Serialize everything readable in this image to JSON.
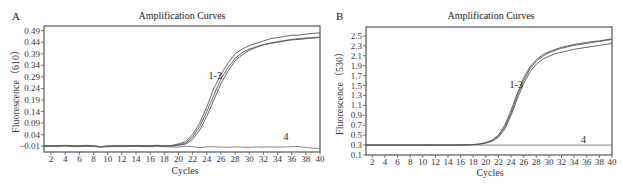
{
  "figure": {
    "panels": [
      "A",
      "B"
    ]
  },
  "chart_data": [
    {
      "panel": "A",
      "type": "line",
      "title": "Amplification Curves",
      "xlabel": "Cycles",
      "ylabel": "Fluorescence（610）",
      "xlim": [
        1,
        40
      ],
      "ylim": [
        -0.035,
        0.51
      ],
      "x_ticks": [
        2,
        4,
        6,
        8,
        10,
        12,
        14,
        16,
        18,
        20,
        22,
        24,
        26,
        28,
        30,
        32,
        34,
        36,
        38,
        40
      ],
      "y_ticks": [
        -0.01,
        0.04,
        0.09,
        0.14,
        0.19,
        0.24,
        0.29,
        0.34,
        0.39,
        0.44,
        0.49
      ],
      "y_tick_labels": [
        "−0.01",
        "0.04",
        "0.09",
        "0.14",
        "0.19",
        "0.24",
        "0.29",
        "0.34",
        "0.39",
        "0.44",
        "0.49"
      ],
      "grid": false,
      "annotations": [
        {
          "text": "1-3",
          "x": 25.2,
          "y": 0.28
        },
        {
          "text": "4",
          "x": 35.2,
          "y": 0.015
        }
      ],
      "x": [
        1,
        2,
        3,
        4,
        5,
        6,
        7,
        8,
        9,
        10,
        11,
        12,
        13,
        14,
        15,
        16,
        17,
        18,
        19,
        20,
        21,
        22,
        23,
        24,
        25,
        26,
        27,
        28,
        29,
        30,
        31,
        32,
        33,
        34,
        35,
        36,
        37,
        38,
        39,
        40
      ],
      "series": [
        {
          "name": "1",
          "values": [
            -0.008,
            -0.01,
            -0.009,
            -0.006,
            -0.008,
            -0.01,
            -0.006,
            -0.009,
            -0.013,
            -0.01,
            -0.008,
            -0.009,
            -0.008,
            -0.007,
            -0.009,
            -0.008,
            -0.006,
            -0.008,
            -0.007,
            0.0,
            0.01,
            0.04,
            0.09,
            0.16,
            0.24,
            0.3,
            0.35,
            0.39,
            0.41,
            0.425,
            0.435,
            0.445,
            0.455,
            0.46,
            0.465,
            0.47,
            0.47,
            0.475,
            0.478,
            0.48
          ]
        },
        {
          "name": "2",
          "values": [
            -0.009,
            -0.008,
            -0.01,
            -0.007,
            -0.009,
            -0.009,
            -0.008,
            -0.01,
            -0.012,
            -0.009,
            -0.009,
            -0.008,
            -0.009,
            -0.008,
            -0.008,
            -0.009,
            -0.007,
            -0.009,
            -0.008,
            -0.004,
            0.003,
            0.03,
            0.075,
            0.14,
            0.21,
            0.28,
            0.33,
            0.37,
            0.395,
            0.41,
            0.42,
            0.43,
            0.435,
            0.44,
            0.445,
            0.45,
            0.452,
            0.455,
            0.458,
            0.46
          ]
        },
        {
          "name": "3",
          "values": [
            -0.01,
            -0.009,
            -0.008,
            -0.008,
            -0.01,
            -0.008,
            -0.009,
            -0.009,
            -0.011,
            -0.01,
            -0.01,
            -0.009,
            -0.01,
            -0.009,
            -0.01,
            -0.009,
            -0.008,
            -0.01,
            -0.009,
            -0.006,
            -0.001,
            0.02,
            0.06,
            0.12,
            0.19,
            0.26,
            0.315,
            0.36,
            0.385,
            0.405,
            0.418,
            0.428,
            0.436,
            0.442,
            0.447,
            0.452,
            0.455,
            0.458,
            0.46,
            0.462
          ]
        },
        {
          "name": "4",
          "values": [
            -0.009,
            -0.011,
            -0.01,
            -0.009,
            -0.011,
            -0.012,
            -0.01,
            -0.011,
            -0.014,
            -0.012,
            -0.011,
            -0.012,
            -0.011,
            -0.01,
            -0.012,
            -0.011,
            -0.01,
            -0.012,
            -0.013,
            -0.014,
            -0.01,
            -0.012,
            -0.016,
            -0.013,
            -0.012,
            -0.014,
            -0.015,
            -0.013,
            -0.014,
            -0.015,
            -0.013,
            -0.014,
            -0.013,
            -0.014,
            -0.013,
            -0.012,
            -0.011,
            -0.015,
            -0.018,
            -0.02
          ]
        }
      ]
    },
    {
      "panel": "B",
      "type": "line",
      "title": "Amplification Curves",
      "xlabel": "Cycles",
      "ylabel": "Fluorescence（530）",
      "xlim": [
        1,
        40
      ],
      "ylim": [
        0.1,
        2.68
      ],
      "x_ticks": [
        2,
        4,
        6,
        8,
        10,
        12,
        14,
        16,
        18,
        20,
        22,
        24,
        26,
        28,
        30,
        32,
        34,
        36,
        38,
        40
      ],
      "y_ticks": [
        0.1,
        0.3,
        0.5,
        0.7,
        0.9,
        1.1,
        1.3,
        1.5,
        1.7,
        1.9,
        2.1,
        2.3,
        2.5
      ],
      "y_tick_labels": [
        "0.1",
        "0.3",
        "0.5",
        "0.7",
        "0.9",
        "1.1",
        "1.3",
        "1.5",
        "1.7",
        "1.9",
        "2.1",
        "2.3",
        "2.5"
      ],
      "grid": false,
      "annotations": [
        {
          "text": "1-3",
          "x": 24.8,
          "y": 1.45
        },
        {
          "text": "4",
          "x": 35.5,
          "y": 0.35
        }
      ],
      "x": [
        1,
        2,
        3,
        4,
        5,
        6,
        7,
        8,
        9,
        10,
        11,
        12,
        13,
        14,
        15,
        16,
        17,
        18,
        19,
        20,
        21,
        22,
        23,
        24,
        25,
        26,
        27,
        28,
        29,
        30,
        31,
        32,
        33,
        34,
        35,
        36,
        37,
        38,
        39,
        40
      ],
      "series": [
        {
          "name": "1",
          "values": [
            0.3,
            0.3,
            0.3,
            0.3,
            0.3,
            0.3,
            0.3,
            0.3,
            0.3,
            0.3,
            0.3,
            0.3,
            0.3,
            0.3,
            0.3,
            0.3,
            0.305,
            0.31,
            0.32,
            0.35,
            0.4,
            0.5,
            0.7,
            1.0,
            1.35,
            1.65,
            1.88,
            2.02,
            2.12,
            2.18,
            2.23,
            2.27,
            2.3,
            2.33,
            2.35,
            2.37,
            2.39,
            2.4,
            2.42,
            2.44
          ]
        },
        {
          "name": "2",
          "values": [
            0.3,
            0.3,
            0.3,
            0.3,
            0.3,
            0.3,
            0.3,
            0.3,
            0.3,
            0.3,
            0.3,
            0.3,
            0.3,
            0.3,
            0.3,
            0.3,
            0.305,
            0.31,
            0.32,
            0.345,
            0.39,
            0.48,
            0.66,
            0.95,
            1.3,
            1.6,
            1.84,
            1.99,
            2.09,
            2.16,
            2.21,
            2.25,
            2.28,
            2.31,
            2.33,
            2.35,
            2.37,
            2.39,
            2.41,
            2.43
          ]
        },
        {
          "name": "3",
          "values": [
            0.3,
            0.3,
            0.3,
            0.3,
            0.3,
            0.3,
            0.3,
            0.3,
            0.3,
            0.3,
            0.3,
            0.3,
            0.3,
            0.3,
            0.3,
            0.3,
            0.305,
            0.31,
            0.32,
            0.34,
            0.38,
            0.46,
            0.62,
            0.9,
            1.24,
            1.54,
            1.78,
            1.93,
            2.03,
            2.09,
            2.14,
            2.17,
            2.2,
            2.23,
            2.25,
            2.27,
            2.29,
            2.31,
            2.33,
            2.35
          ]
        },
        {
          "name": "4",
          "values": [
            0.3,
            0.3,
            0.3,
            0.3,
            0.3,
            0.3,
            0.3,
            0.3,
            0.3,
            0.3,
            0.3,
            0.3,
            0.3,
            0.3,
            0.3,
            0.3,
            0.3,
            0.3,
            0.3,
            0.3,
            0.3,
            0.3,
            0.3,
            0.3,
            0.3,
            0.3,
            0.3,
            0.3,
            0.3,
            0.3,
            0.3,
            0.3,
            0.3,
            0.3,
            0.3,
            0.3,
            0.3,
            0.3,
            0.3,
            0.3
          ]
        }
      ]
    }
  ]
}
